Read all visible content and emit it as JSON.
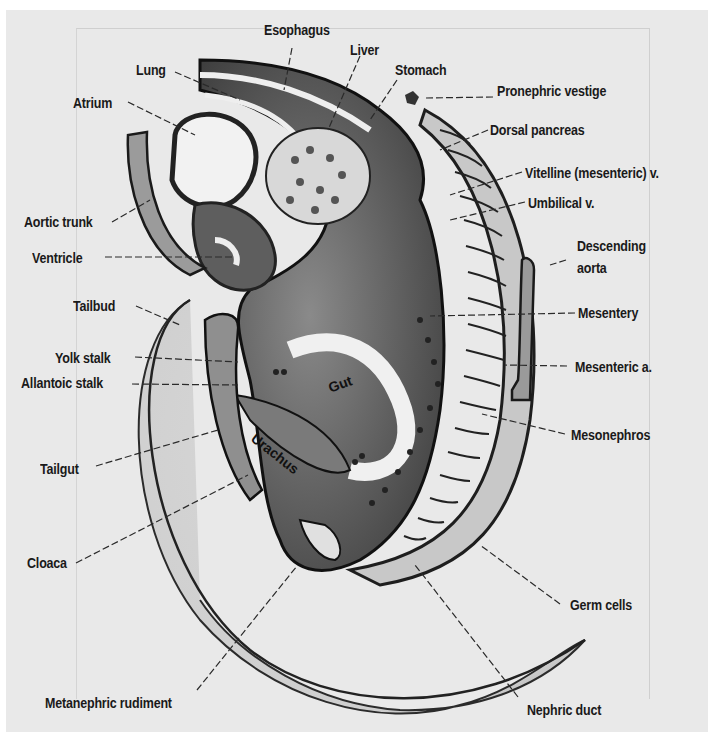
{
  "figure": {
    "background_color": "#e9e9e9",
    "ink_color": "#1a1a1a"
  },
  "labels": {
    "esophagus": "Esophagus",
    "liver": "Liver",
    "lung": "Lung",
    "stomach": "Stomach",
    "pronephric_vestige": "Pronephric vestige",
    "atrium": "Atrium",
    "dorsal_pancreas": "Dorsal pancreas",
    "vitelline_v": "Vitelline (mesenteric) v.",
    "aortic_trunk": "Aortic trunk",
    "umbilical_v": "Umbilical v.",
    "ventricle": "Ventricle",
    "descending_aorta_1": "Descending",
    "descending_aorta_2": "aorta",
    "tailbud": "Tailbud",
    "mesentery": "Mesentery",
    "yolk_stalk": "Yolk stalk",
    "mesenteric_a": "Mesenteric a.",
    "allantoic_stalk": "Allantoic stalk",
    "gut": "Gut",
    "urachus": "Urachus",
    "mesonephros": "Mesonephros",
    "tailgut": "Tailgut",
    "cloaca": "Cloaca",
    "germ_cells": "Germ cells",
    "metanephric_rudiment": "Metanephric rudiment",
    "nephric_duct": "Nephric duct"
  }
}
